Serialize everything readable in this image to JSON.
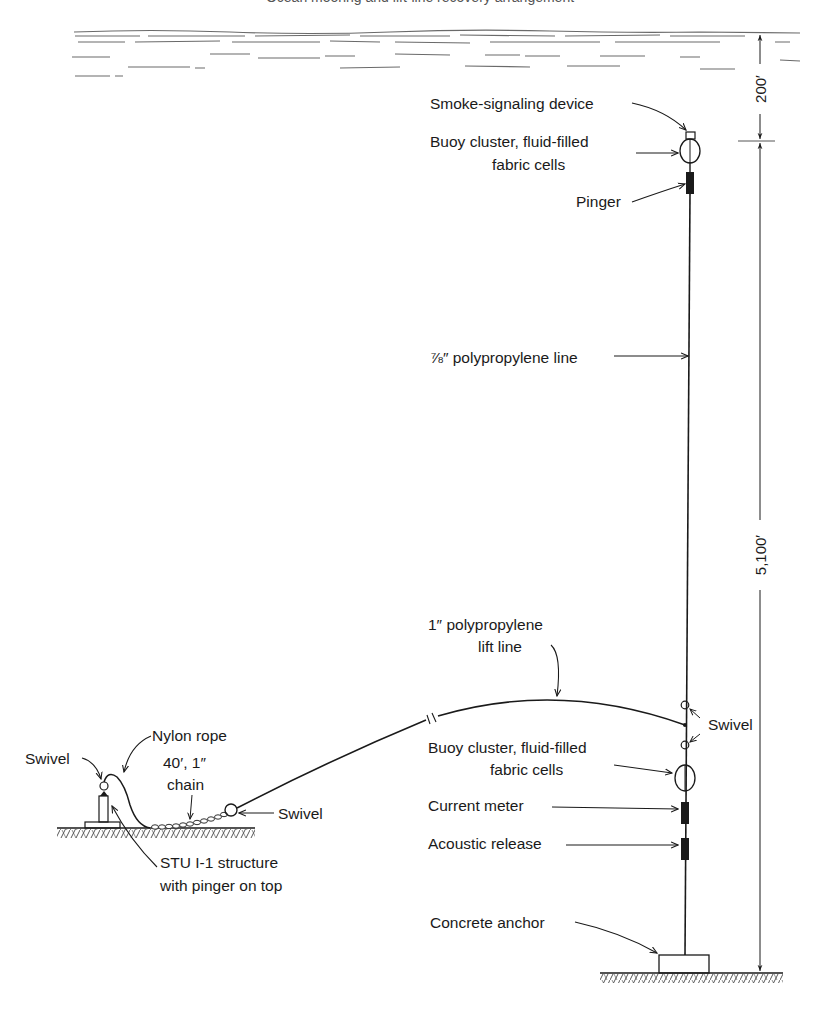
{
  "header": {
    "cut_off_caption": "Ocean mooring and lift-line recovery arrangement"
  },
  "surface": {
    "name": "sea-surface"
  },
  "dimensions": {
    "surface_to_buoy": "200′",
    "buoy_to_seafloor": "5,100′"
  },
  "labels": {
    "smoke_device": "Smoke-signaling device",
    "upper_buoy_line1": "Buoy cluster, fluid-filled",
    "upper_buoy_line2": "fabric cells",
    "pinger": "Pinger",
    "main_line": "⅞″ polypropylene line",
    "lift_line_1": "1″ polypropylene",
    "lift_line_2": "lift line",
    "swivel_right": "Swivel",
    "lower_buoy_line1": "Buoy cluster, fluid-filled",
    "lower_buoy_line2": "fabric cells",
    "current_meter": "Current meter",
    "acoustic_release": "Acoustic release",
    "concrete_anchor": "Concrete anchor",
    "swivel_left": "Swivel",
    "nylon_rope": "Nylon rope",
    "chain_line1": "40′, 1″",
    "chain_line2": "chain",
    "swivel_chain": "Swivel",
    "stu_line1": "STU I-1 structure",
    "stu_line2": "with pinger on top"
  },
  "colors": {
    "ink": "#1a1a1a",
    "water": "#6a6a6a",
    "background": "#ffffff"
  }
}
